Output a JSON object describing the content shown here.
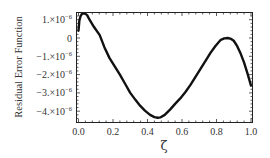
{
  "chart_data": {
    "type": "line",
    "title": "",
    "xlabel": "ζ",
    "ylabel": "Residual Error Function",
    "xlim": [
      0,
      1
    ],
    "ylim": [
      -4.45e-06,
      1.45e-06
    ],
    "grid": false,
    "legend": null,
    "x_ticks": [
      0.0,
      0.2,
      0.4,
      0.6,
      0.8,
      1.0
    ],
    "x_tick_labels": [
      "0.0",
      "0.2",
      "0.4",
      "0.6",
      "0.8",
      "1.0"
    ],
    "y_ticks": [
      1e-06,
      0,
      -1e-06,
      -2e-06,
      -3e-06,
      -4e-06
    ],
    "y_tick_labels": [
      {
        "mantissa": "1.×10",
        "exp": "−6"
      },
      {
        "mantissa": "0",
        "exp": ""
      },
      {
        "mantissa": "−1.×10",
        "exp": "−6"
      },
      {
        "mantissa": "−2.×10",
        "exp": "−6"
      },
      {
        "mantissa": "−3.×10",
        "exp": "−6"
      },
      {
        "mantissa": "−4.×10",
        "exp": "−6"
      }
    ],
    "series": [
      {
        "name": "Residual Error Function",
        "color": "#111111",
        "x": [
          0.0,
          0.005,
          0.012,
          0.02,
          0.03,
          0.04,
          0.05,
          0.064,
          0.09,
          0.123,
          0.15,
          0.18,
          0.21,
          0.24,
          0.27,
          0.3,
          0.33,
          0.357,
          0.385,
          0.415,
          0.44,
          0.46,
          0.474,
          0.5,
          0.532,
          0.56,
          0.59,
          0.62,
          0.65,
          0.68,
          0.71,
          0.74,
          0.766,
          0.795,
          0.825,
          0.845,
          0.865,
          0.885,
          0.9,
          0.92,
          0.94,
          0.96,
          0.98,
          1.0
        ],
        "y": [
          4e-07,
          9.5e-07,
          1.2e-06,
          1.32e-06,
          1.35e-06,
          1.32e-06,
          1.25e-06,
          1e-06,
          6e-07,
          1.6e-07,
          -5e-07,
          -1.1e-06,
          -1.55e-06,
          -2e-06,
          -2.5e-06,
          -3e-06,
          -3.38e-06,
          -3.7e-06,
          -3.97e-06,
          -4.2e-06,
          -4.32e-06,
          -4.36e-06,
          -4.34e-06,
          -4.2e-06,
          -3.9e-06,
          -3.6e-06,
          -3.3e-06,
          -2.95e-06,
          -2.55e-06,
          -2.1e-06,
          -1.65e-06,
          -1.2e-06,
          -8e-07,
          -4.2e-07,
          -1e-07,
          -2e-08,
          0.0,
          -5e-08,
          -1.5e-07,
          -4.5e-07,
          -8.5e-07,
          -1.35e-06,
          -1.95e-06,
          -2.6e-06
        ]
      }
    ]
  }
}
